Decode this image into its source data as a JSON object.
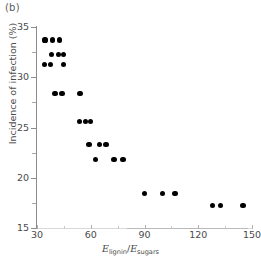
{
  "panel": {
    "label": "(b)"
  },
  "chart_data": {
    "type": "scatter",
    "title": "",
    "panel_label": "(b)",
    "xlabel": "E_lignin / E_sugars",
    "xlabel_parts": {
      "num_symbol": "E",
      "num_sub": "lignin",
      "separator": "/",
      "den_symbol": "E",
      "den_sub": "sugars"
    },
    "ylabel": "Incidence of infection (%)",
    "xlim": [
      30,
      150
    ],
    "ylim": [
      15,
      35
    ],
    "xticks": [
      30,
      60,
      90,
      120,
      150
    ],
    "xticklabels": [
      "30",
      "60",
      "90",
      "120",
      "150"
    ],
    "xticks_minor": [
      45,
      75,
      105,
      135
    ],
    "yticks": [
      15,
      20,
      25,
      30,
      35
    ],
    "yticklabels": [
      "15",
      "20",
      "25",
      "30",
      "35"
    ],
    "yticks_minor": [
      17.5,
      22.5,
      27.5,
      32.5
    ],
    "grid": false,
    "legend": null,
    "marker": {
      "shape": "circle",
      "color": "#000000",
      "size_px": 5.2
    },
    "series": [
      {
        "name": "samples",
        "points": [
          {
            "x": 34.5,
            "y": 33.7
          },
          {
            "x": 38.5,
            "y": 33.7
          },
          {
            "x": 42.5,
            "y": 33.7
          },
          {
            "x": 38.0,
            "y": 32.3
          },
          {
            "x": 42.0,
            "y": 32.3
          },
          {
            "x": 45.0,
            "y": 32.3
          },
          {
            "x": 34.0,
            "y": 31.3
          },
          {
            "x": 37.5,
            "y": 31.3
          },
          {
            "x": 45.0,
            "y": 31.3
          },
          {
            "x": 40.0,
            "y": 28.4
          },
          {
            "x": 44.0,
            "y": 28.4
          },
          {
            "x": 54.0,
            "y": 28.4
          },
          {
            "x": 53.5,
            "y": 25.6
          },
          {
            "x": 57.0,
            "y": 25.6
          },
          {
            "x": 60.0,
            "y": 25.6
          },
          {
            "x": 59.0,
            "y": 23.3
          },
          {
            "x": 65.0,
            "y": 23.3
          },
          {
            "x": 68.5,
            "y": 23.3
          },
          {
            "x": 62.5,
            "y": 21.8
          },
          {
            "x": 73.0,
            "y": 21.8
          },
          {
            "x": 78.0,
            "y": 21.8
          },
          {
            "x": 90.0,
            "y": 18.4
          },
          {
            "x": 100.0,
            "y": 18.4
          },
          {
            "x": 107.0,
            "y": 18.4
          },
          {
            "x": 128.0,
            "y": 17.2
          },
          {
            "x": 132.5,
            "y": 17.2
          },
          {
            "x": 145.0,
            "y": 17.2
          }
        ]
      }
    ]
  },
  "colors": {
    "marker": "#000000",
    "axis": "#8c8c8c",
    "xaxis_faint": "#d8d8d8",
    "text": "#4a4a4a",
    "background": "#ffffff"
  }
}
